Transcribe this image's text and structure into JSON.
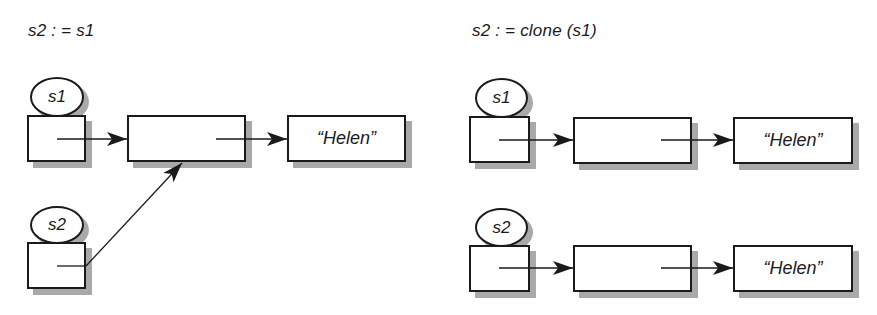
{
  "left_panel": {
    "title": "s2 : = s1",
    "variables": [
      {
        "label": "s1"
      },
      {
        "label": "s2"
      }
    ],
    "objects": [
      {
        "label": ""
      },
      {
        "label": "“Helen”"
      }
    ],
    "description": "s1 and s2 both reference the same object, which references the string “Helen”"
  },
  "right_panel": {
    "title": "s2 : = clone (s1)",
    "variables": [
      {
        "label": "s1"
      },
      {
        "label": "s2"
      }
    ],
    "objects": [
      {
        "label": ""
      },
      {
        "label": "“Helen”"
      },
      {
        "label": ""
      },
      {
        "label": "“Helen”"
      }
    ],
    "description": "s1 and s2 reference separate copies of the object, each referencing the same string “Helen”"
  },
  "colors": {
    "stroke": "#1a1a1a",
    "shadow": "#a9a9a9",
    "fill": "#ffffff"
  }
}
